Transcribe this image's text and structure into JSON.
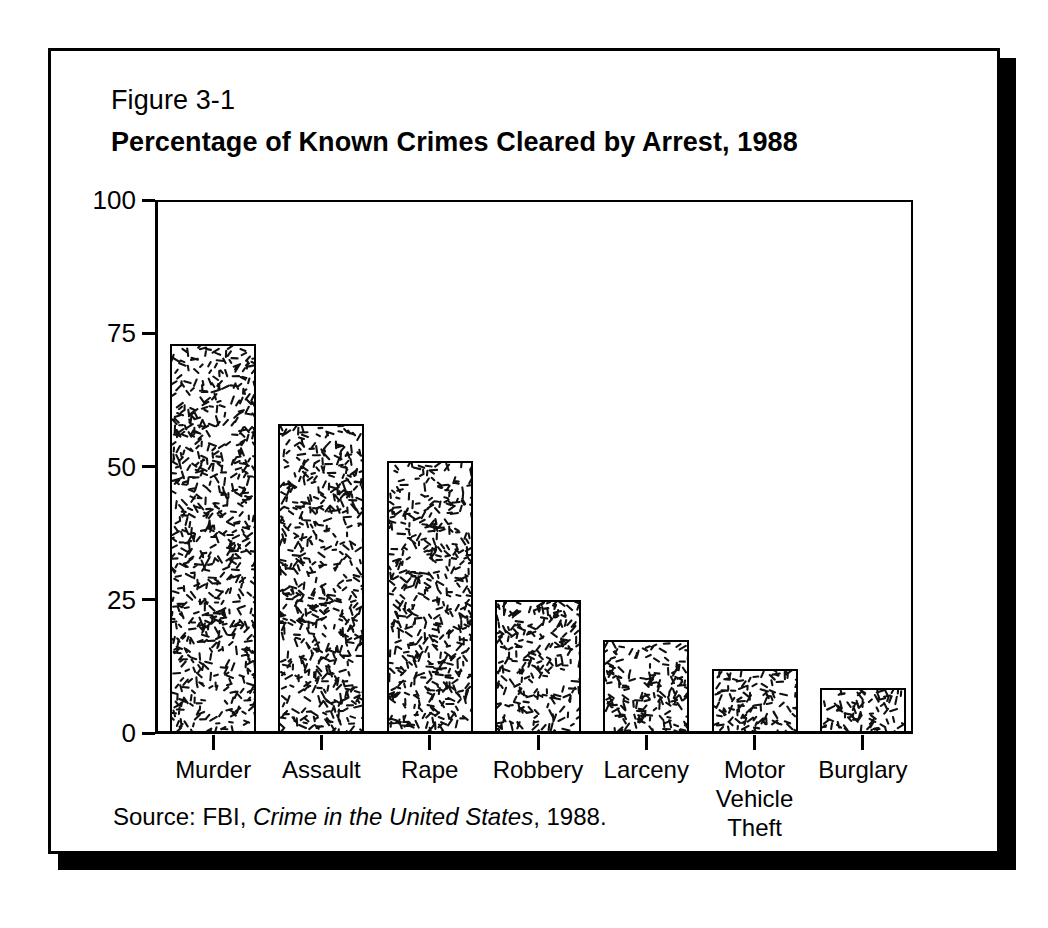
{
  "figure": {
    "number": "Figure 3-1",
    "title": "Percentage of Known Crimes Cleared by Arrest, 1988",
    "source_prefix": "Source: FBI, ",
    "source_italic": "Crime in the United States",
    "source_suffix": ", 1988."
  },
  "chart_data": {
    "type": "bar",
    "title": "Percentage of Known Crimes Cleared by Arrest, 1988",
    "subtitle": "Figure 3-1",
    "xlabel": "",
    "ylabel": "",
    "ylim": [
      0,
      100
    ],
    "yticks": [
      0,
      25,
      50,
      75,
      100
    ],
    "ytick_labels": [
      "0",
      "25",
      "50",
      "75",
      "100"
    ],
    "grid": false,
    "legend": false,
    "categories": [
      "Murder",
      "Assault",
      "Rape",
      "Robbery",
      "Larceny",
      "Motor\nVehicle\nTheft",
      "Burglary"
    ],
    "values": [
      73,
      58,
      51,
      25,
      17.5,
      12,
      8.5
    ],
    "series": [
      {
        "name": "Percentage cleared by arrest",
        "values": [
          73,
          58,
          51,
          25,
          17.5,
          12,
          8.5
        ]
      }
    ],
    "bar_fill": "speckled-hatch",
    "bar_edge_color": "#000000",
    "source": "Source: FBI, Crime in the United States, 1988."
  },
  "colors": {
    "ink": "#000000",
    "paper": "#ffffff"
  }
}
